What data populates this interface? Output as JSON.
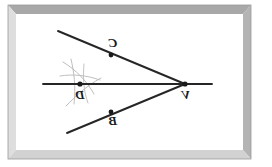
{
  "figure": {
    "background_color": "#ffffff",
    "ink_color": "#262626",
    "frame": {
      "name": "beveled-frame",
      "outer_color": "#9a9a9a",
      "top_color": "#a6a6a6",
      "left_color": "#d8d8d8",
      "right_color": "#b0b0b0",
      "bottom_color": "#cfcfcf",
      "inner_background": "#ffffff"
    },
    "orientation_note": "mirrored",
    "points": [
      {
        "id": "V",
        "label": "V",
        "x": 185,
        "y": 84,
        "label_x": 186,
        "label_y": 99,
        "marker": true
      },
      {
        "id": "C",
        "label": "C",
        "x": 111,
        "y": 55,
        "label_x": 113,
        "label_y": 47,
        "marker": true
      },
      {
        "id": "B",
        "label": "B",
        "x": 111,
        "y": 112,
        "label_x": 113,
        "label_y": 125,
        "marker": true
      },
      {
        "id": "D",
        "label": "D",
        "x": 80,
        "y": 84,
        "label_x": 80,
        "label_y": 99,
        "marker": true
      }
    ],
    "segments": [
      {
        "name": "ray-upper-VC",
        "x1": 58,
        "y1": 31,
        "x2": 185,
        "y2": 84,
        "width": 1.9
      },
      {
        "name": "ray-lower-VB",
        "x1": 67,
        "y1": 133,
        "x2": 185,
        "y2": 84,
        "width": 1.9
      },
      {
        "name": "bisector-line",
        "x1": 43,
        "y1": 84,
        "x2": 212,
        "y2": 84,
        "width": 1.9
      }
    ],
    "arcs": [
      {
        "name": "construction-arc-1",
        "d": "M 63 62 C 76 70 86 80 94 94",
        "color": "#b4b4b4"
      },
      {
        "name": "construction-arc-2",
        "d": "M 66 106 C 76 96 86 86 101 78",
        "color": "#b4b4b4"
      },
      {
        "name": "construction-arc-3",
        "d": "M 71 59 C 74 72 76 86 74 104",
        "color": "#b4b4b4"
      },
      {
        "name": "construction-arc-4",
        "d": "M 60 76 C 72 74 86 75 100 80",
        "color": "#b4b4b4"
      },
      {
        "name": "construction-arc-5",
        "d": "M 84 64 C 83 76 83 90 88 103",
        "color": "#b8b8b8"
      }
    ]
  }
}
